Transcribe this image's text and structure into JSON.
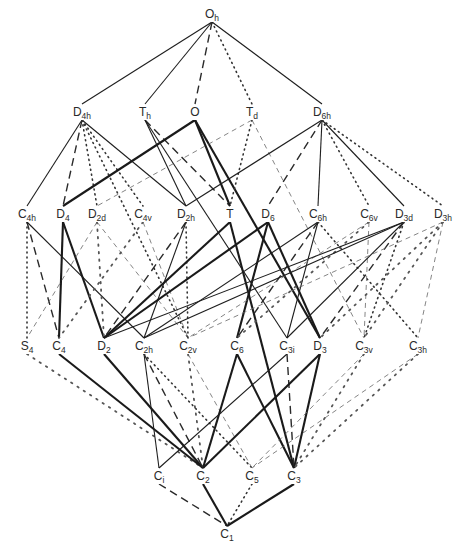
{
  "nodes": [
    {
      "id": "Oh",
      "base": "O",
      "sub": "h",
      "x": 212,
      "y": 18
    },
    {
      "id": "D4h",
      "base": "D",
      "sub": "4h",
      "x": 82,
      "y": 116
    },
    {
      "id": "Th",
      "base": "T",
      "sub": "h",
      "x": 145,
      "y": 116
    },
    {
      "id": "O",
      "base": "O",
      "sub": "",
      "x": 195,
      "y": 116
    },
    {
      "id": "Td",
      "base": "T",
      "sub": "d",
      "x": 252,
      "y": 116
    },
    {
      "id": "D6h",
      "base": "D",
      "sub": "6h",
      "x": 322,
      "y": 116
    },
    {
      "id": "C4h",
      "base": "C",
      "sub": "4h",
      "x": 27,
      "y": 218
    },
    {
      "id": "D4",
      "base": "D",
      "sub": "4",
      "x": 63,
      "y": 218
    },
    {
      "id": "D2d",
      "base": "D",
      "sub": "2d",
      "x": 97,
      "y": 218
    },
    {
      "id": "C4v",
      "base": "C",
      "sub": "4v",
      "x": 143,
      "y": 218
    },
    {
      "id": "D2h",
      "base": "D",
      "sub": "2h",
      "x": 186,
      "y": 218
    },
    {
      "id": "T",
      "base": "T",
      "sub": "",
      "x": 230,
      "y": 218
    },
    {
      "id": "D6",
      "base": "D",
      "sub": "6",
      "x": 268,
      "y": 218
    },
    {
      "id": "C6h",
      "base": "C",
      "sub": "6h",
      "x": 318,
      "y": 218
    },
    {
      "id": "C6v",
      "base": "C",
      "sub": "6v",
      "x": 369,
      "y": 218
    },
    {
      "id": "D3d",
      "base": "D",
      "sub": "3d",
      "x": 404,
      "y": 218
    },
    {
      "id": "D3h",
      "base": "D",
      "sub": "3h",
      "x": 443,
      "y": 218
    },
    {
      "id": "S4",
      "base": "S",
      "sub": "4",
      "x": 27,
      "y": 350
    },
    {
      "id": "C4",
      "base": "C",
      "sub": "4",
      "x": 59,
      "y": 350
    },
    {
      "id": "D2",
      "base": "D",
      "sub": "2",
      "x": 104,
      "y": 350
    },
    {
      "id": "C2h",
      "base": "C",
      "sub": "2h",
      "x": 144,
      "y": 350
    },
    {
      "id": "C2v",
      "base": "C",
      "sub": "2v",
      "x": 188,
      "y": 350
    },
    {
      "id": "C6",
      "base": "C",
      "sub": "6",
      "x": 237,
      "y": 350
    },
    {
      "id": "C3i",
      "base": "C",
      "sub": "3i",
      "x": 287,
      "y": 350
    },
    {
      "id": "D3",
      "base": "D",
      "sub": "3",
      "x": 320,
      "y": 350
    },
    {
      "id": "C3v",
      "base": "C",
      "sub": "3v",
      "x": 364,
      "y": 350
    },
    {
      "id": "C3h",
      "base": "C",
      "sub": "3h",
      "x": 418,
      "y": 350
    },
    {
      "id": "Ci",
      "base": "C",
      "sub": "i",
      "x": 159,
      "y": 480
    },
    {
      "id": "C2",
      "base": "C",
      "sub": "2",
      "x": 203,
      "y": 480
    },
    {
      "id": "C5",
      "base": "C",
      "sub": "5",
      "x": 252,
      "y": 480
    },
    {
      "id": "C3",
      "base": "C",
      "sub": "3",
      "x": 294,
      "y": 480
    },
    {
      "id": "C1",
      "base": "C",
      "sub": "1",
      "x": 227,
      "y": 538
    }
  ],
  "edges": [
    {
      "from": "Oh",
      "to": "D4h",
      "style": "solid"
    },
    {
      "from": "Oh",
      "to": "Th",
      "style": "solid"
    },
    {
      "from": "Oh",
      "to": "O",
      "style": "dashed"
    },
    {
      "from": "Oh",
      "to": "Td",
      "style": "dotted"
    },
    {
      "from": "Oh",
      "to": "D6h",
      "style": "solid"
    },
    {
      "from": "D4h",
      "to": "C4h",
      "style": "solid"
    },
    {
      "from": "D4h",
      "to": "D4",
      "style": "dashed"
    },
    {
      "from": "D4h",
      "to": "D2d",
      "style": "dotted"
    },
    {
      "from": "D4h",
      "to": "C4v",
      "style": "dotted"
    },
    {
      "from": "D4h",
      "to": "D2h",
      "style": "solid"
    },
    {
      "from": "D4h",
      "to": "C2v",
      "style": "dotted"
    },
    {
      "from": "Th",
      "to": "D2h",
      "style": "solid"
    },
    {
      "from": "Th",
      "to": "T",
      "style": "dashed"
    },
    {
      "from": "Th",
      "to": "C3i",
      "style": "solid"
    },
    {
      "from": "O",
      "to": "D4",
      "style": "thick"
    },
    {
      "from": "O",
      "to": "T",
      "style": "thick"
    },
    {
      "from": "O",
      "to": "D3",
      "style": "thick"
    },
    {
      "from": "Td",
      "to": "D2d",
      "style": "thin-dashed"
    },
    {
      "from": "Td",
      "to": "T",
      "style": "dotted"
    },
    {
      "from": "Td",
      "to": "C3v",
      "style": "thin-dashed"
    },
    {
      "from": "D6h",
      "to": "D2h",
      "style": "solid"
    },
    {
      "from": "D6h",
      "to": "D6",
      "style": "dashed"
    },
    {
      "from": "D6h",
      "to": "C6h",
      "style": "solid"
    },
    {
      "from": "D6h",
      "to": "C6v",
      "style": "dotted"
    },
    {
      "from": "D6h",
      "to": "D3d",
      "style": "solid"
    },
    {
      "from": "D6h",
      "to": "D3h",
      "style": "dotted"
    },
    {
      "from": "C4h",
      "to": "S4",
      "style": "dotted"
    },
    {
      "from": "C4h",
      "to": "C4",
      "style": "dashed"
    },
    {
      "from": "C4h",
      "to": "C2h",
      "style": "solid"
    },
    {
      "from": "D4",
      "to": "C4",
      "style": "thick"
    },
    {
      "from": "D4",
      "to": "D2",
      "style": "thick"
    },
    {
      "from": "D2d",
      "to": "S4",
      "style": "thin-dashed"
    },
    {
      "from": "D2d",
      "to": "D2",
      "style": "open-dotted"
    },
    {
      "from": "D2d",
      "to": "C2v",
      "style": "thin-dashed"
    },
    {
      "from": "C4v",
      "to": "C4",
      "style": "open-dotted"
    },
    {
      "from": "C4v",
      "to": "C2v",
      "style": "thin-dashed"
    },
    {
      "from": "D2h",
      "to": "D2",
      "style": "dashed"
    },
    {
      "from": "D2h",
      "to": "C2h",
      "style": "solid"
    },
    {
      "from": "D2h",
      "to": "C2v",
      "style": "dotted"
    },
    {
      "from": "T",
      "to": "D2",
      "style": "thick"
    },
    {
      "from": "T",
      "to": "C3",
      "style": "thick"
    },
    {
      "from": "D6",
      "to": "D2",
      "style": "thick"
    },
    {
      "from": "D6",
      "to": "C6",
      "style": "thick"
    },
    {
      "from": "D6",
      "to": "D3",
      "style": "thick"
    },
    {
      "from": "C6h",
      "to": "C2h",
      "style": "solid"
    },
    {
      "from": "C6h",
      "to": "C6",
      "style": "dashed"
    },
    {
      "from": "C6h",
      "to": "C3i",
      "style": "solid"
    },
    {
      "from": "C6h",
      "to": "C3h",
      "style": "dotted"
    },
    {
      "from": "C6v",
      "to": "C2v",
      "style": "thin-dashed"
    },
    {
      "from": "C6v",
      "to": "C6",
      "style": "open-dotted"
    },
    {
      "from": "C6v",
      "to": "C3v",
      "style": "thin-dashed"
    },
    {
      "from": "D3d",
      "to": "D2",
      "style": "solid"
    },
    {
      "from": "D3d",
      "to": "C2h",
      "style": "solid"
    },
    {
      "from": "D3d",
      "to": "C3i",
      "style": "solid"
    },
    {
      "from": "D3d",
      "to": "D3",
      "style": "dashed"
    },
    {
      "from": "D3d",
      "to": "C3v",
      "style": "dotted"
    },
    {
      "from": "D3h",
      "to": "C2v",
      "style": "thin-dashed"
    },
    {
      "from": "D3h",
      "to": "D3",
      "style": "open-dotted"
    },
    {
      "from": "D3h",
      "to": "C3v",
      "style": "open-dotted"
    },
    {
      "from": "D3h",
      "to": "C3h",
      "style": "thin-dashed"
    },
    {
      "from": "S4",
      "to": "C2",
      "style": "open-dotted"
    },
    {
      "from": "C4",
      "to": "C2",
      "style": "thick"
    },
    {
      "from": "D2",
      "to": "C2",
      "style": "thick"
    },
    {
      "from": "C2h",
      "to": "Ci",
      "style": "solid"
    },
    {
      "from": "C2h",
      "to": "C2",
      "style": "dashed"
    },
    {
      "from": "C2h",
      "to": "C5",
      "style": "dotted"
    },
    {
      "from": "C2v",
      "to": "C2",
      "style": "open-dotted"
    },
    {
      "from": "C2v",
      "to": "C5",
      "style": "thin-dashed"
    },
    {
      "from": "C6",
      "to": "C2",
      "style": "thick"
    },
    {
      "from": "C6",
      "to": "C3",
      "style": "thick"
    },
    {
      "from": "C3i",
      "to": "Ci",
      "style": "solid"
    },
    {
      "from": "C3i",
      "to": "C3",
      "style": "dashed"
    },
    {
      "from": "D3",
      "to": "C2",
      "style": "thick"
    },
    {
      "from": "D3",
      "to": "C3",
      "style": "thick"
    },
    {
      "from": "C3v",
      "to": "C5",
      "style": "thin-dashed"
    },
    {
      "from": "C3v",
      "to": "C3",
      "style": "open-dotted"
    },
    {
      "from": "C3h",
      "to": "C5",
      "style": "thin-dashed"
    },
    {
      "from": "C3h",
      "to": "C3",
      "style": "open-dotted"
    },
    {
      "from": "Ci",
      "to": "C1",
      "style": "dashed"
    },
    {
      "from": "C2",
      "to": "C1",
      "style": "thick"
    },
    {
      "from": "C5",
      "to": "C1",
      "style": "dotted"
    },
    {
      "from": "C3",
      "to": "C1",
      "style": "thick"
    }
  ]
}
